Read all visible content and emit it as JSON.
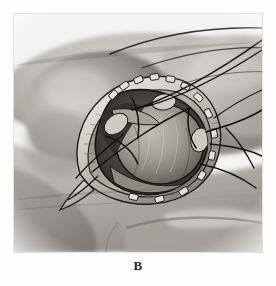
{
  "plate": {
    "caption": "B",
    "figure_label": "surgical-illustration",
    "subject": "operative field exposure",
    "medium": "halftone engraving, grayscale"
  },
  "palette": {
    "paper": "#fdfdfd",
    "plate_background": "#f2f2f0",
    "skin_light": "#d9d6d1",
    "skin_mid": "#b3afa9",
    "skin_shadow": "#8b8782",
    "skin_deep_shadow": "#6b6762",
    "wound_rim_light": "#e6e2db",
    "wound_rim_mid": "#a9a49c",
    "cavity_dark": "#4a4742",
    "cavity_deep": "#2e2c29",
    "mass_light": "#b5b0a8",
    "mass_mid": "#918c84",
    "mass_shadow": "#6a655e",
    "suture_line": "#14130f",
    "caption_text": "#2b2b2b",
    "frame_edge": "#e2e2e0"
  },
  "figure_parts": {
    "body_contour": "torso and upper arm in three-quarter view",
    "incision": "teardrop-shaped surgical opening, apex lower-left",
    "wound_edge": "everted retracted skin-fat margin with clips",
    "cavity_contents": "rounded exposed mass within dissected cavity",
    "vessels": "branching dark vessel and suture lines crossing upper right",
    "clips_count": 14
  },
  "annotations": {
    "caption_position": "below-center",
    "border": "thin light rule around plate"
  }
}
